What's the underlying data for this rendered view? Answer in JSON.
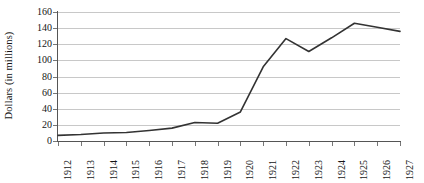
{
  "chart_data": {
    "type": "line",
    "title": "",
    "subtitle": "",
    "xlabel": "",
    "ylabel": "Dollars (in millions)",
    "categories": [
      "1912",
      "1913",
      "1914",
      "1915",
      "1916",
      "1917",
      "1918",
      "1919",
      "1920",
      "1921",
      "1922",
      "1923",
      "1924",
      "1925",
      "1926",
      "1927"
    ],
    "values": [
      7,
      8,
      10,
      10.5,
      13,
      16,
      23,
      22,
      36,
      92,
      127,
      111,
      128,
      146,
      141,
      136
    ],
    "series": [
      {
        "name": "Dollars (in millions)",
        "values": [
          7,
          8,
          10,
          10.5,
          13,
          16,
          23,
          22,
          36,
          92,
          127,
          111,
          128,
          146,
          141,
          136
        ]
      }
    ],
    "ylim": [
      0,
      160
    ],
    "ytick_labels": [
      "0",
      "20",
      "40",
      "60",
      "80",
      "100",
      "120",
      "140",
      "160"
    ],
    "ytick_values": [
      0,
      20,
      40,
      60,
      80,
      100,
      120,
      140,
      160
    ],
    "ytick_step": 20,
    "xtick_labels": [
      "1912",
      "1913",
      "1914",
      "1915",
      "1916",
      "1917",
      "1918",
      "1919",
      "1920",
      "1921",
      "1922",
      "1923",
      "1924",
      "1925",
      "1926",
      "1927"
    ],
    "xtick_rotation": 90,
    "grid": {
      "horizontal": true,
      "vertical": false,
      "color": "#c8c8c8"
    },
    "legend": {
      "visible": false,
      "position": "none",
      "entries": []
    },
    "line_color": "#333333",
    "line_width": 1.6,
    "markers": "none",
    "background_color": "#ffffff",
    "axis_color": "#555555",
    "text_color": "#151515",
    "annotations": []
  }
}
